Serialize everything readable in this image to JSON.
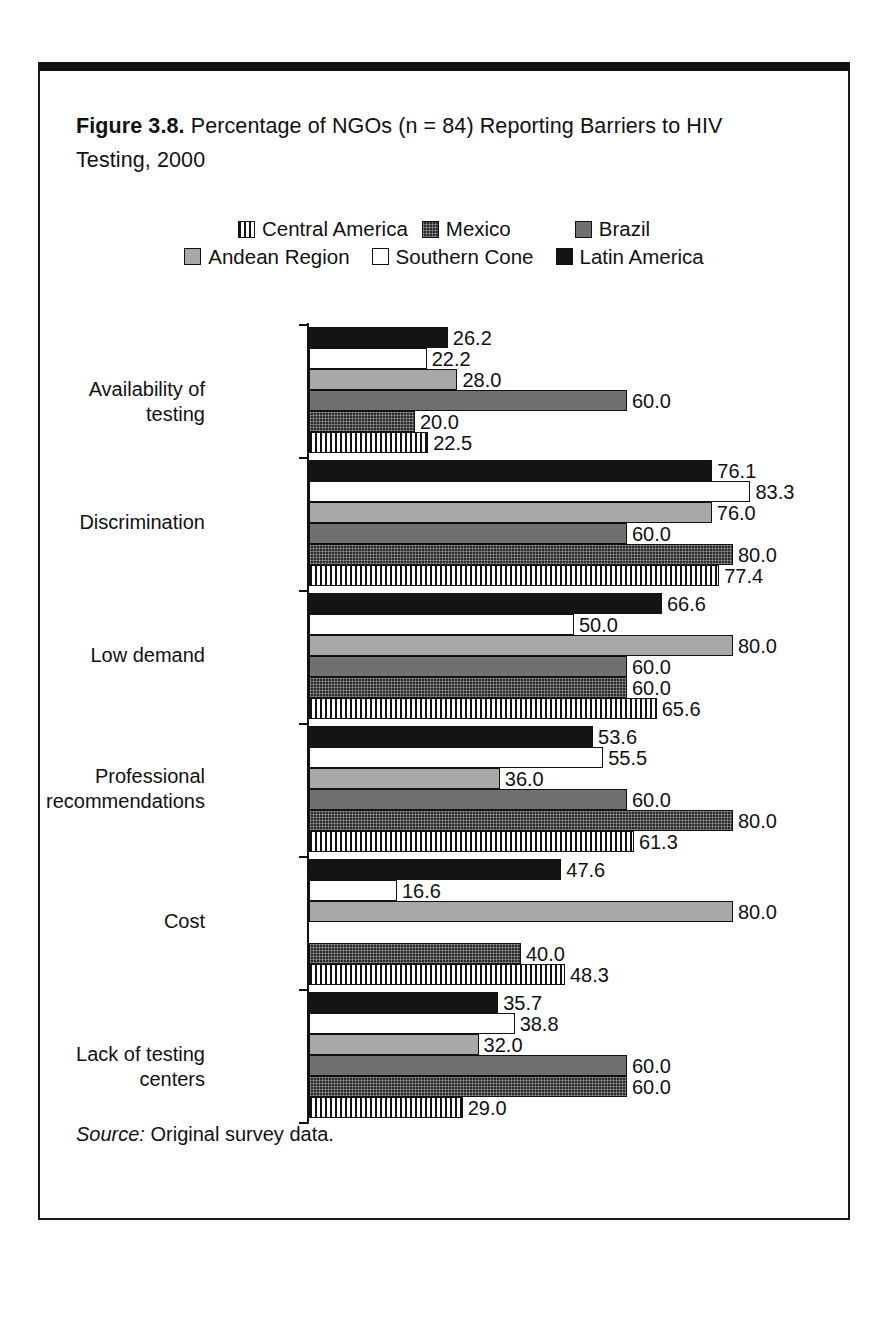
{
  "figure": {
    "number_label": "Figure 3.8.",
    "caption": " Percentage of NGOs (n = 84) Reporting Barriers to HIV Testing, 2000",
    "source_label": "Source:",
    "source_text": " Original survey data."
  },
  "legend": {
    "rows": [
      [
        {
          "label": "Central America",
          "swatch": "vertical-stripe-swatch"
        },
        {
          "label": "Mexico",
          "swatch": "dark-crosshatch-swatch"
        },
        {
          "label": "Brazil",
          "swatch": "medium-gray-swatch"
        }
      ],
      [
        {
          "label": "Andean Region",
          "swatch": "light-gray-swatch"
        },
        {
          "label": "Southern Cone",
          "swatch": "white-swatch"
        },
        {
          "label": "Latin America",
          "swatch": "black-swatch"
        }
      ]
    ]
  },
  "colors": {
    "central_america": "#ffffff",
    "mexico": "#2b2b2b",
    "brazil": "#707070",
    "andean_region": "#a8a8a8",
    "southern_cone": "#ffffff",
    "latin_america": "#141414",
    "axis": "#111111",
    "frame": "#1a1a1a"
  },
  "chart_data": {
    "type": "bar",
    "orientation": "horizontal",
    "title": "Figure 3.8. Percentage of NGOs (n = 84) Reporting Barriers to HIV Testing, 2000",
    "xlabel": "",
    "ylabel": "",
    "xlim": [
      0,
      90
    ],
    "grid": false,
    "legend_position": "top-center",
    "categories": [
      "Availability of testing",
      "Discrimination",
      "Low demand",
      "Professional recommendations",
      "Cost",
      "Lack of testing centers"
    ],
    "series": [
      {
        "name": "Central America",
        "values": [
          22.5,
          77.4,
          65.6,
          61.3,
          35.7,
          29.0
        ],
        "labels": [
          "22.5",
          "77.4",
          "65.6",
          "61.3",
          "35.7",
          "29.0"
        ]
      },
      {
        "name": "Mexico",
        "values": [
          20.0,
          80.0,
          60.0,
          80.0,
          40.0,
          60.0
        ],
        "labels": [
          "20.0",
          "80.0",
          "60.0",
          "80.0",
          "40.0",
          "60.0"
        ]
      },
      {
        "name": "Brazil",
        "values": [
          60.0,
          60.0,
          60.0,
          60.0,
          0.0,
          60.0
        ],
        "labels": [
          "60.0",
          "60.0",
          "60.0",
          "60.0",
          "",
          "60.0"
        ]
      },
      {
        "name": "Andean Region",
        "values": [
          28.0,
          76.0,
          80.0,
          36.0,
          80.0,
          32.0
        ],
        "labels": [
          "28.0",
          "76.0",
          "80.0",
          "36.0",
          "80.0",
          "32.0"
        ]
      },
      {
        "name": "Southern Cone",
        "values": [
          22.2,
          83.3,
          50.0,
          55.5,
          16.6,
          38.8
        ],
        "labels": [
          "22.2",
          "83.3",
          "50.0",
          "55.5",
          "16.6",
          "38.8"
        ]
      },
      {
        "name": "Latin America",
        "values": [
          26.2,
          76.1,
          66.6,
          53.6,
          47.6,
          47.6
        ],
        "labels": [
          "26.2",
          "76.1",
          "66.6",
          "53.6",
          "47.6",
          "47.6"
        ]
      }
    ],
    "groups": [
      {
        "category": "Availability of testing",
        "bars": [
          {
            "series": "Latin America",
            "value": 26.2,
            "label": "26.2"
          },
          {
            "series": "Southern Cone",
            "value": 22.2,
            "label": "22.2"
          },
          {
            "series": "Andean Region",
            "value": 28.0,
            "label": "28.0"
          },
          {
            "series": "Brazil",
            "value": 60.0,
            "label": "60.0"
          },
          {
            "series": "Mexico",
            "value": 20.0,
            "label": "20.0"
          },
          {
            "series": "Central America",
            "value": 22.5,
            "label": "22.5"
          }
        ]
      },
      {
        "category": "Discrimination",
        "bars": [
          {
            "series": "Latin America",
            "value": 76.1,
            "label": "76.1"
          },
          {
            "series": "Southern Cone",
            "value": 83.3,
            "label": "83.3"
          },
          {
            "series": "Andean Region",
            "value": 76.0,
            "label": "76.0"
          },
          {
            "series": "Brazil",
            "value": 60.0,
            "label": "60.0"
          },
          {
            "series": "Mexico",
            "value": 80.0,
            "label": "80.0"
          },
          {
            "series": "Central America",
            "value": 77.4,
            "label": "77.4"
          }
        ]
      },
      {
        "category": "Low demand",
        "bars": [
          {
            "series": "Latin America",
            "value": 66.6,
            "label": "66.6"
          },
          {
            "series": "Southern Cone",
            "value": 50.0,
            "label": "50.0"
          },
          {
            "series": "Andean Region",
            "value": 80.0,
            "label": "80.0"
          },
          {
            "series": "Brazil",
            "value": 60.0,
            "label": "60.0"
          },
          {
            "series": "Mexico",
            "value": 60.0,
            "label": "60.0"
          },
          {
            "series": "Central America",
            "value": 65.6,
            "label": "65.6"
          }
        ]
      },
      {
        "category": "Professional\nrecommendations",
        "bars": [
          {
            "series": "Latin America",
            "value": 53.6,
            "label": "53.6"
          },
          {
            "series": "Southern Cone",
            "value": 55.5,
            "label": "55.5"
          },
          {
            "series": "Andean Region",
            "value": 36.0,
            "label": "36.0"
          },
          {
            "series": "Brazil",
            "value": 60.0,
            "label": "60.0"
          },
          {
            "series": "Mexico",
            "value": 80.0,
            "label": "80.0"
          },
          {
            "series": "Central America",
            "value": 61.3,
            "label": "61.3"
          }
        ]
      },
      {
        "category": "Cost",
        "bars": [
          {
            "series": "Latin America",
            "value": 47.6,
            "label": "47.6"
          },
          {
            "series": "Southern Cone",
            "value": 16.6,
            "label": "16.6"
          },
          {
            "series": "Andean Region",
            "value": 80.0,
            "label": "80.0"
          },
          {
            "series": "Brazil",
            "value": 0.0,
            "label": ""
          },
          {
            "series": "Mexico",
            "value": 40.0,
            "label": "40.0"
          },
          {
            "series": "Central America",
            "value": 48.3,
            "label": "48.3"
          }
        ]
      },
      {
        "category": "Lack of testing centers",
        "bars": [
          {
            "series": "Latin America",
            "value": 35.7,
            "label": "35.7"
          },
          {
            "series": "Southern Cone",
            "value": 38.8,
            "label": "38.8"
          },
          {
            "series": "Andean Region",
            "value": 32.0,
            "label": "32.0"
          },
          {
            "series": "Brazil",
            "value": 60.0,
            "label": "60.0"
          },
          {
            "series": "Mexico",
            "value": 60.0,
            "label": "60.0"
          },
          {
            "series": "Central America",
            "value": 29.0,
            "label": "29.0"
          }
        ]
      }
    ]
  }
}
